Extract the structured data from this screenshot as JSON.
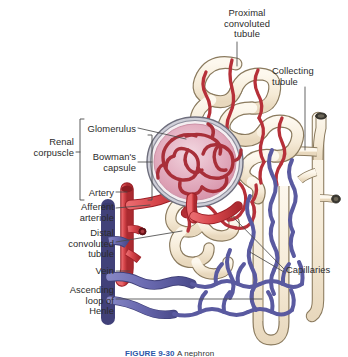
{
  "figure": {
    "caption_label": "FIGURE 9-30",
    "caption_rest": "A nephron",
    "background_color": "#ffffff",
    "text_color": "#2b2b2b",
    "leader_color": "#4a4a4a"
  },
  "palette": {
    "artery_red": "#d6454a",
    "artery_red_dark": "#a8262c",
    "vein_blue": "#6a6ab0",
    "vein_blue_dark": "#474785",
    "tubule_cream": "#f6eedd",
    "tubule_outline": "#8a7a5e",
    "capsule_pink": "#e6b7c6",
    "capsule_pink_deep": "#d98fa6",
    "capsule_ring": "#7d7d8c",
    "glomerulus_red": "#b83a44",
    "caption_blue": "#2b56a8"
  },
  "labels": [
    {
      "id": "proximal-convoluted-tubule",
      "text": "Proximal\nconvoluted\ntubule",
      "align": "center",
      "x": 208,
      "y": 8,
      "width": 78
    },
    {
      "id": "collecting-tubule",
      "text": "Collecting\ntubule",
      "align": "left",
      "x": 272,
      "y": 66,
      "width": 72
    },
    {
      "id": "glomerulus",
      "text": "Glomerulus",
      "align": "right",
      "x": 58,
      "y": 124,
      "width": 78
    },
    {
      "id": "renal-corpuscle",
      "text": "Renal\ncorpuscle",
      "align": "right",
      "x": 8,
      "y": 137,
      "width": 66
    },
    {
      "id": "bowmans-capsule",
      "text": "Bowman's\ncapsule",
      "align": "right",
      "x": 58,
      "y": 152,
      "width": 78
    },
    {
      "id": "artery",
      "text": "Artery",
      "align": "right",
      "x": 48,
      "y": 188,
      "width": 66
    },
    {
      "id": "afferent-arteriole",
      "text": "Afferent\narteriole",
      "align": "right",
      "x": 42,
      "y": 202,
      "width": 72
    },
    {
      "id": "distal-convoluted-tubule",
      "text": "Distal\nconvoluted\ntubule",
      "align": "right",
      "x": 30,
      "y": 228,
      "width": 84
    },
    {
      "id": "vein",
      "text": "Vein",
      "align": "right",
      "x": 48,
      "y": 266,
      "width": 66
    },
    {
      "id": "ascending-loop-of-henle",
      "text": "Ascending\nloop of\nHenle",
      "align": "right",
      "x": 30,
      "y": 285,
      "width": 84
    },
    {
      "id": "capillaries",
      "text": "Capillaries",
      "align": "left",
      "x": 286,
      "y": 265,
      "width": 62
    }
  ],
  "structures": [
    {
      "id": "glomerulus",
      "name": "Glomerulus",
      "color": "#b83a44"
    },
    {
      "id": "bowmans-capsule",
      "name": "Bowman's capsule",
      "color": "#e6b7c6"
    },
    {
      "id": "proximal-convoluted-tubule",
      "name": "Proximal convoluted tubule",
      "color": "#f6eedd"
    },
    {
      "id": "distal-convoluted-tubule",
      "name": "Distal convoluted tubule",
      "color": "#f6eedd"
    },
    {
      "id": "collecting-tubule",
      "name": "Collecting tubule",
      "color": "#f6eedd"
    },
    {
      "id": "loop-of-henle",
      "name": "Ascending loop of Henle",
      "color": "#f6eedd"
    },
    {
      "id": "artery",
      "name": "Artery",
      "color": "#d6454a"
    },
    {
      "id": "afferent-arteriole",
      "name": "Afferent arteriole",
      "color": "#d6454a"
    },
    {
      "id": "vein",
      "name": "Vein",
      "color": "#6a6ab0"
    },
    {
      "id": "capillaries-arterial",
      "name": "Arterial capillaries",
      "color": "#d6454a"
    },
    {
      "id": "capillaries-venous",
      "name": "Venous capillaries",
      "color": "#6a6ab0"
    }
  ]
}
